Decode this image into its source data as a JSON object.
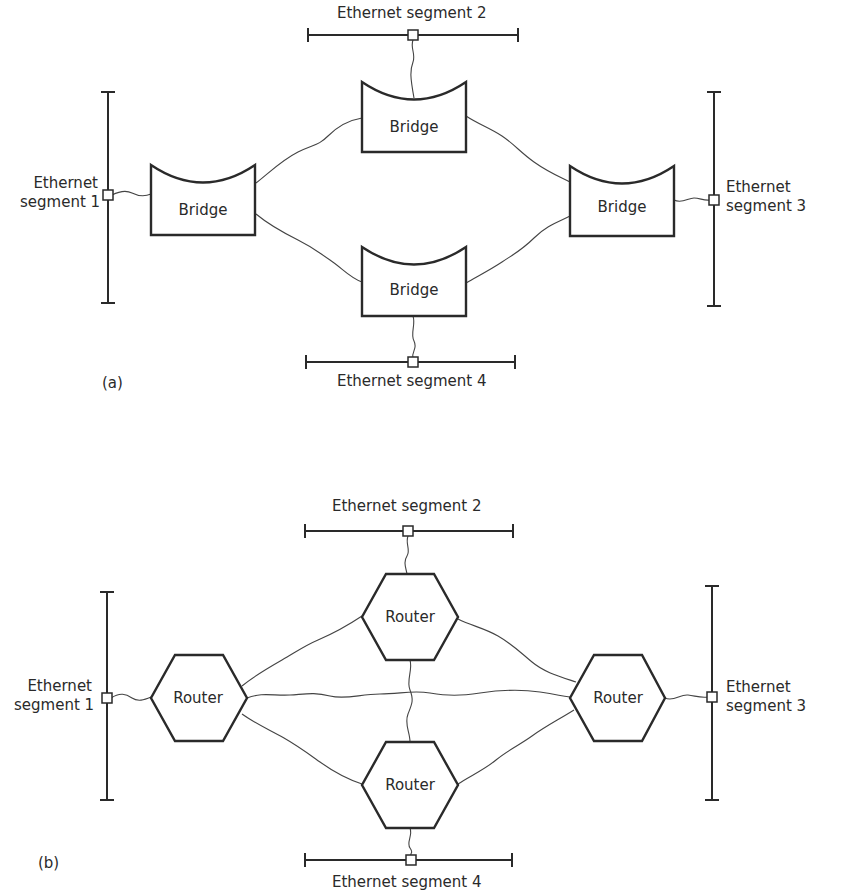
{
  "diagrams": [
    {
      "id": "a",
      "caption": "(a)",
      "device_type": "Bridge",
      "segments": {
        "seg1": {
          "line1": "Ethernet",
          "line2": "segment 1"
        },
        "seg2": {
          "label": "Ethernet segment 2"
        },
        "seg3": {
          "line1": "Ethernet",
          "line2": "segment 3"
        },
        "seg4": {
          "label": "Ethernet segment 4"
        }
      },
      "nodes": {
        "left": "Bridge",
        "top": "Bridge",
        "right": "Bridge",
        "bottom": "Bridge"
      },
      "links": [
        [
          "segment 1",
          "left bridge"
        ],
        [
          "segment 2",
          "top bridge"
        ],
        [
          "segment 3",
          "right bridge"
        ],
        [
          "segment 4",
          "bottom bridge"
        ],
        [
          "left bridge",
          "top bridge"
        ],
        [
          "left bridge",
          "bottom bridge"
        ],
        [
          "top bridge",
          "right bridge"
        ],
        [
          "bottom bridge",
          "right bridge"
        ]
      ]
    },
    {
      "id": "b",
      "caption": "(b)",
      "device_type": "Router",
      "segments": {
        "seg1": {
          "line1": "Ethernet",
          "line2": "segment 1"
        },
        "seg2": {
          "label": "Ethernet segment 2"
        },
        "seg3": {
          "line1": "Ethernet",
          "line2": "segment 3"
        },
        "seg4": {
          "label": "Ethernet segment 4"
        }
      },
      "nodes": {
        "left": "Router",
        "top": "Router",
        "right": "Router",
        "bottom": "Router"
      },
      "links": [
        [
          "segment 1",
          "left router"
        ],
        [
          "segment 2",
          "top router"
        ],
        [
          "segment 3",
          "right router"
        ],
        [
          "segment 4",
          "bottom router"
        ],
        [
          "left router",
          "top router"
        ],
        [
          "left router",
          "bottom router"
        ],
        [
          "left router",
          "right router"
        ],
        [
          "top router",
          "right router"
        ],
        [
          "bottom router",
          "right router"
        ],
        [
          "top router",
          "bottom router"
        ]
      ]
    }
  ]
}
